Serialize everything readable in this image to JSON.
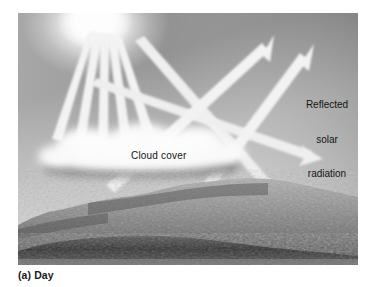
{
  "figure": {
    "caption": "(a) Day",
    "panel_label": "(a)",
    "panel_title": "Day",
    "background_color": "#ffffff"
  },
  "illustration": {
    "name": "daytime-cloud-albedo-diagram",
    "sky": {
      "color_top_left": "#9a9a9a",
      "color_top_right": "#6e6e6e",
      "color_bottom": "#d4d4d4"
    },
    "sun": {
      "name": "sun-glow",
      "center_x": 95,
      "center_y": 22,
      "color": "#ffffff"
    },
    "cloud": {
      "name": "cloud-layer",
      "top_color": "#f2f2f2",
      "shadow_color": "#6f6f6f"
    },
    "terrain": {
      "name": "mountain-terrain",
      "ridge_color": "#9d9d9d",
      "valley_color": "#3a3a3a"
    },
    "arrows": {
      "ray_color": "#f2f2f2",
      "incoming_count": 5,
      "reflected_up_count": 2,
      "incoming_down_count": 2
    }
  },
  "labels": {
    "cloud_cover": "Cloud cover",
    "reflected_line1": "Reflected",
    "reflected_line2": "solar",
    "reflected_line3": "radiation"
  }
}
